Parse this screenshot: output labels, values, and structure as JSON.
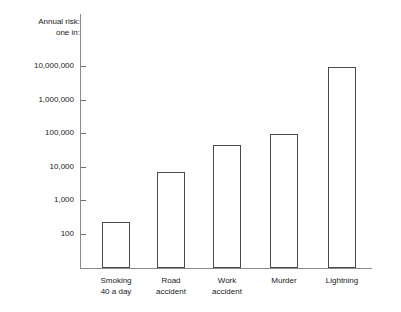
{
  "chart_data": {
    "type": "bar",
    "title": "Annual risk:\none in:",
    "xlabel": "",
    "ylabel": "Annual risk: one in:",
    "yscale": "log",
    "ylim": [
      30,
      30000000
    ],
    "grid": false,
    "legend": null,
    "categories": [
      "Smoking\n40 a day",
      "Road\naccident",
      "Work\naccident",
      "Murder",
      "Lightning"
    ],
    "values": [
      230,
      7000,
      45000,
      95000,
      10000000
    ],
    "ytick_labels": [
      "10,000,000",
      "1,000,000",
      "100,000",
      "10,000",
      "1,000",
      "100"
    ],
    "ytick_values": [
      10000000,
      1000000,
      100000,
      10000,
      1000,
      100
    ]
  },
  "style": {
    "bar_stroke": "#4a4a4a",
    "bar_fill": "#ffffff",
    "axis_color": "#8a8a8a",
    "text_color": "#1a1a1a",
    "background": "#ffffff"
  },
  "geometry": {
    "baseline_y": 268,
    "decade_px": 33.5,
    "y_100_px": 234,
    "bars": [
      {
        "left": 102,
        "width": 28,
        "top": 223
      },
      {
        "left": 157,
        "width": 28,
        "top": 171
      },
      {
        "left": 213,
        "width": 28,
        "top": 144
      },
      {
        "left": 270,
        "width": 28,
        "top": 133
      },
      {
        "left": 328,
        "width": 28,
        "top": 64
      }
    ],
    "ticks_y": [
      66,
      99.5,
      133,
      166.5,
      200,
      233.5
    ]
  }
}
